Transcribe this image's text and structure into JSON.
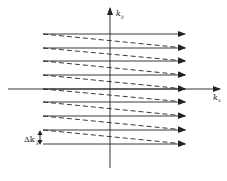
{
  "diagram": {
    "title": "",
    "axes": {
      "x": {
        "label": "k",
        "subscript": "x"
      },
      "y": {
        "label": "k",
        "subscript": "y"
      }
    },
    "annotation": {
      "delta_label": "Δk",
      "delta_subscript": "y"
    },
    "line_color": "#222222",
    "solid_lines_y": [
      34,
      48,
      61,
      75,
      89,
      102,
      116,
      130,
      144
    ],
    "line_x_start": 43,
    "line_x_end": 185
  }
}
